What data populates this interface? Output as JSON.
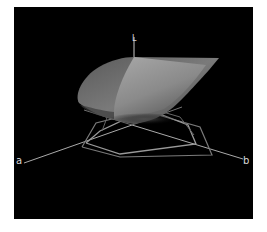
{
  "figure": {
    "type": "3d-gamut-plot",
    "background_color": "#000000",
    "frame_color": "#ffffff",
    "surface_colors": {
      "outer_shell": "#6a6a6a",
      "inner_face": "#9a9a9a",
      "shadow": "#3a3a3a"
    },
    "line_color": "#8c8c8c",
    "axes": {
      "a": {
        "label": "a"
      },
      "b": {
        "label": "b"
      },
      "L": {
        "label": "L"
      }
    }
  }
}
